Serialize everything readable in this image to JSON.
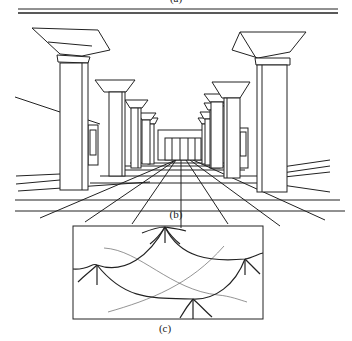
{
  "figure": {
    "captions": {
      "a": "(a)",
      "b": "(b)",
      "c": "(c)"
    },
    "panel_b": {
      "description": "One-point perspective drawing of a colonnade: two rows of square columns with flared capitals receding toward a central vanishing point over a gridded tiled floor, with a low building at the end of the corridor."
    },
    "panel_c": {
      "description": "Boxed sketch of a draped/tensile canopy: curved catenary cables hanging between support masts, with thin diagonal crossing lines."
    },
    "colors": {
      "line": "#222222",
      "thin_line": "#555555",
      "background": "#ffffff"
    }
  }
}
